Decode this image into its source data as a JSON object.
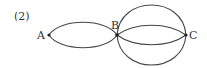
{
  "figure": {
    "label": "(2)",
    "vertices": [
      {
        "name": "A",
        "x": 49,
        "y": 35
      },
      {
        "name": "B",
        "x": 117,
        "y": 35
      },
      {
        "name": "C",
        "x": 186,
        "y": 35
      }
    ],
    "edges": [
      {
        "from": "A",
        "to": "B",
        "type": "upper-arc"
      },
      {
        "from": "A",
        "to": "B",
        "type": "lower-arc"
      },
      {
        "from": "B",
        "to": "C",
        "type": "outer-upper-arc"
      },
      {
        "from": "B",
        "to": "C",
        "type": "inner-upper-arc"
      },
      {
        "from": "B",
        "to": "C",
        "type": "inner-lower-arc"
      },
      {
        "from": "B",
        "to": "C",
        "type": "outer-lower-arc"
      }
    ],
    "stroke_color": "#444444"
  }
}
